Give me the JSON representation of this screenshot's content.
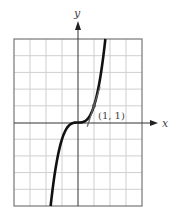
{
  "chart_data": {
    "type": "line",
    "title": "",
    "function": "y = x^3",
    "xlabel": "x",
    "ylabel": "y",
    "xlim": [
      -4,
      4
    ],
    "ylim": [
      -5,
      5
    ],
    "grid": true,
    "grid_step": {
      "x": 1,
      "y": 1
    },
    "series": [
      {
        "name": "curve",
        "x": [
          -1.71,
          -1.5,
          -1.25,
          -1,
          -0.75,
          -0.5,
          -0.25,
          0,
          0.25,
          0.5,
          0.75,
          1,
          1.25,
          1.5,
          1.71
        ],
        "y": [
          -5,
          -3.375,
          -1.953,
          -1,
          -0.422,
          -0.125,
          -0.016,
          0,
          0.016,
          0.125,
          0.422,
          1,
          1.953,
          3.375,
          5
        ]
      },
      {
        "name": "tangent-line",
        "x": [
          0.58,
          1.38
        ],
        "y": [
          -0.25,
          2.15
        ]
      }
    ],
    "annotations": [
      {
        "text": "(1, 1)",
        "x": 1,
        "y": 1
      }
    ],
    "legend": null
  },
  "labels": {
    "x_axis": "x",
    "y_axis": "y",
    "point": "(1, 1)"
  },
  "colors": {
    "curve": "#111111",
    "tangent": "#666666",
    "grid": "#cfcfcf",
    "frame": "#777777",
    "axis": "#333333"
  }
}
